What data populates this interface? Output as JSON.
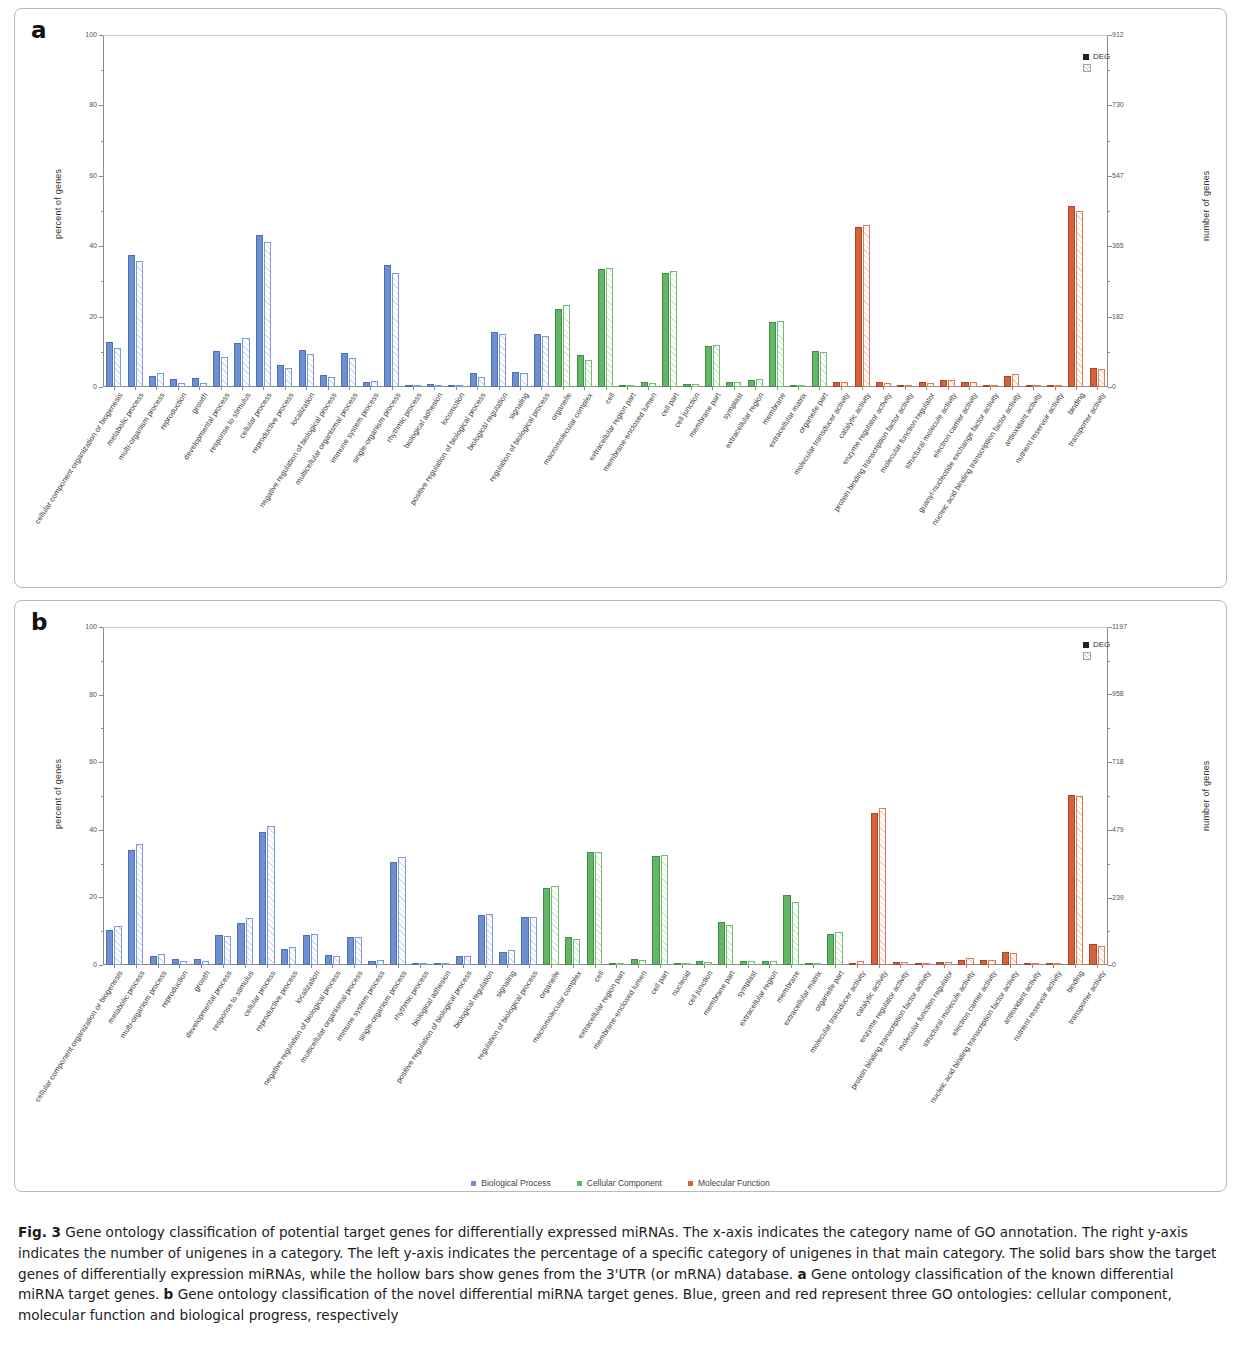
{
  "figure": {
    "label": "Fig. 3",
    "caption_parts": [
      {
        "bold": "Fig. 3",
        "text": " Gene ontology classification of potential target genes for differentially expressed miRNAs. The x-axis indicates the category name of GO annotation. The right y-axis indicates the number of unigenes in a category. The left y-axis indicates the percentage of a specific category of unigenes in that main category. The solid bars show the target genes of differentially expression miRNAs, while the hollow bars show genes from the 3'UTR (or mRNA) database. "
      },
      {
        "bold": "a",
        "text": " Gene ontology classification of the known differential miRNA target genes. "
      },
      {
        "bold": "b",
        "text": " Gene ontology classification of the novel differential miRNA target genes. Blue, green and red represent three GO ontologies: cellular component, molecular function and biological progress, respectively"
      }
    ]
  },
  "bottom_legend": [
    {
      "label": "Biological Process",
      "color": "#6e8fd0"
    },
    {
      "label": "Cellular Component",
      "color": "#64b565"
    },
    {
      "label": "Molecular Function",
      "color": "#d4623b"
    }
  ],
  "panel_a": {
    "letter": "a",
    "legend": [
      {
        "label": "DEG",
        "type": "solid"
      },
      {
        "label": "",
        "type": "hollow"
      }
    ],
    "chart_data": {
      "type": "bar",
      "title": "Gene ontology classification of the known differential miRNA target genes",
      "xlabel": "",
      "ylabel": "percent of genes",
      "y2label": "number of genes",
      "ylim": [
        0,
        100
      ],
      "yticks": [
        0,
        20,
        40,
        60,
        80,
        100
      ],
      "y2lim": [
        0,
        912
      ],
      "y2ticks": [
        0,
        182,
        365,
        547,
        730,
        912
      ],
      "grid": false,
      "legend_position": "top-right",
      "series": [
        {
          "name": "DEG",
          "style": "solid"
        },
        {
          "name": "database",
          "style": "hollow"
        }
      ],
      "groups": [
        {
          "category": "cellular component organization or biogenesis",
          "ontology": "bp",
          "deg": 12.9,
          "db": 11.0
        },
        {
          "category": "metabolic process",
          "ontology": "bp",
          "deg": 37.5,
          "db": 35.9
        },
        {
          "category": "multi-organism process",
          "ontology": "bp",
          "deg": 3.1,
          "db": 3.9
        },
        {
          "category": "reproduction",
          "ontology": "bp",
          "deg": 2.3,
          "db": 1.2
        },
        {
          "category": "growth",
          "ontology": "bp",
          "deg": 2.6,
          "db": 1.2
        },
        {
          "category": "developmental process",
          "ontology": "bp",
          "deg": 10.2,
          "db": 8.6
        },
        {
          "category": "response to stimulus",
          "ontology": "bp",
          "deg": 12.4,
          "db": 13.8
        },
        {
          "category": "cellular process",
          "ontology": "bp",
          "deg": 43.3,
          "db": 41.2
        },
        {
          "category": "reproductive process",
          "ontology": "bp",
          "deg": 6.3,
          "db": 5.3
        },
        {
          "category": "localization",
          "ontology": "bp",
          "deg": 10.4,
          "db": 9.4
        },
        {
          "category": "negative regulation of biological process",
          "ontology": "bp",
          "deg": 3.3,
          "db": 2.8
        },
        {
          "category": "multicellular organismal process",
          "ontology": "bp",
          "deg": 9.7,
          "db": 8.2
        },
        {
          "category": "immune system process",
          "ontology": "bp",
          "deg": 1.4,
          "db": 1.6
        },
        {
          "category": "single-organism process",
          "ontology": "bp",
          "deg": 34.6,
          "db": 32.4
        },
        {
          "category": "rhythmic process",
          "ontology": "bp",
          "deg": 0.7,
          "db": 0.6
        },
        {
          "category": "biological adhesion",
          "ontology": "bp",
          "deg": 0.8,
          "db": 0.6
        },
        {
          "category": "locomotion",
          "ontology": "bp",
          "deg": 0.2,
          "db": 0.2
        },
        {
          "category": "positive regulation of biological process",
          "ontology": "bp",
          "deg": 3.9,
          "db": 2.8
        },
        {
          "category": "biological regulation",
          "ontology": "bp",
          "deg": 15.6,
          "db": 15.2
        },
        {
          "category": "signaling",
          "ontology": "bp",
          "deg": 4.4,
          "db": 4.0
        },
        {
          "category": "regulation of biological process",
          "ontology": "bp",
          "deg": 15.2,
          "db": 14.4
        },
        {
          "category": "organelle",
          "ontology": "cc",
          "deg": 22.3,
          "db": 23.4
        },
        {
          "category": "macromolecular complex",
          "ontology": "cc",
          "deg": 9.0,
          "db": 7.8
        },
        {
          "category": "cell",
          "ontology": "cc",
          "deg": 33.5,
          "db": 33.9
        },
        {
          "category": "extracellular region part",
          "ontology": "cc",
          "deg": 0.2,
          "db": 0.2
        },
        {
          "category": "membrane-enclosed lumen",
          "ontology": "cc",
          "deg": 1.5,
          "db": 1.1
        },
        {
          "category": "cell part",
          "ontology": "cc",
          "deg": 32.3,
          "db": 33.0
        },
        {
          "category": "cell junction",
          "ontology": "cc",
          "deg": 0.9,
          "db": 0.9
        },
        {
          "category": "membrane part",
          "ontology": "cc",
          "deg": 11.6,
          "db": 11.9
        },
        {
          "category": "symplast",
          "ontology": "cc",
          "deg": 1.5,
          "db": 1.3
        },
        {
          "category": "extracellular region",
          "ontology": "cc",
          "deg": 1.9,
          "db": 2.4
        },
        {
          "category": "membrane",
          "ontology": "cc",
          "deg": 18.6,
          "db": 18.8
        },
        {
          "category": "extracellular matrix",
          "ontology": "cc",
          "deg": 0.2,
          "db": 0.3
        },
        {
          "category": "organelle part",
          "ontology": "cc",
          "deg": 10.2,
          "db": 9.9
        },
        {
          "category": "molecular transducer activity",
          "ontology": "mf",
          "deg": 1.3,
          "db": 1.4
        },
        {
          "category": "catalytic activity",
          "ontology": "mf",
          "deg": 45.6,
          "db": 46.0
        },
        {
          "category": "enzyme regulator activity",
          "ontology": "mf",
          "deg": 1.3,
          "db": 1.1
        },
        {
          "category": "protein binding transcription factor activity",
          "ontology": "mf",
          "deg": 0.3,
          "db": 0.3
        },
        {
          "category": "molecular function regulator",
          "ontology": "mf",
          "deg": 1.3,
          "db": 1.1
        },
        {
          "category": "structural molecule activity",
          "ontology": "mf",
          "deg": 1.9,
          "db": 2.1
        },
        {
          "category": "electron carrier activity",
          "ontology": "mf",
          "deg": 1.5,
          "db": 1.5
        },
        {
          "category": "guanyl-nucleotide exchange factor activity",
          "ontology": "mf",
          "deg": 0.3,
          "db": 0.3
        },
        {
          "category": "nucleic acid binding transcription factor activity",
          "ontology": "mf",
          "deg": 3.1,
          "db": 3.6
        },
        {
          "category": "antioxidant activity",
          "ontology": "mf",
          "deg": 0.5,
          "db": 0.5
        },
        {
          "category": "nutrient reservoir activity",
          "ontology": "mf",
          "deg": 0.2,
          "db": 0.2
        },
        {
          "category": "binding",
          "ontology": "mf",
          "deg": 51.3,
          "db": 50.1
        },
        {
          "category": "transporter activity",
          "ontology": "mf",
          "deg": 5.4,
          "db": 5.1
        }
      ]
    }
  },
  "panel_b": {
    "letter": "b",
    "legend": [
      {
        "label": "DEG",
        "type": "solid"
      },
      {
        "label": "",
        "type": "hollow"
      }
    ],
    "chart_data": {
      "type": "bar",
      "title": "Gene ontology classification of the novel differential miRNA target genes",
      "xlabel": "",
      "ylabel": "percent of genes",
      "y2label": "number of genes",
      "ylim": [
        0,
        100
      ],
      "yticks": [
        0,
        20,
        40,
        60,
        80,
        100
      ],
      "y2lim": [
        0,
        1197
      ],
      "y2ticks": [
        0,
        239,
        479,
        718,
        958,
        1197
      ],
      "grid": false,
      "legend_position": "top-right",
      "series": [
        {
          "name": "DEG",
          "style": "solid"
        },
        {
          "name": "database",
          "style": "hollow"
        }
      ],
      "groups": [
        {
          "category": "cellular component organization or biogenesis",
          "ontology": "bp",
          "deg": 10.4,
          "db": 11.6
        },
        {
          "category": "metabolic process",
          "ontology": "bp",
          "deg": 34.1,
          "db": 35.9
        },
        {
          "category": "multi-organism process",
          "ontology": "bp",
          "deg": 2.8,
          "db": 3.3
        },
        {
          "category": "reproduction",
          "ontology": "bp",
          "deg": 1.7,
          "db": 1.3
        },
        {
          "category": "growth",
          "ontology": "bp",
          "deg": 1.8,
          "db": 1.3
        },
        {
          "category": "developmental process",
          "ontology": "bp",
          "deg": 9.0,
          "db": 8.6
        },
        {
          "category": "response to stimulus",
          "ontology": "bp",
          "deg": 12.5,
          "db": 13.8
        },
        {
          "category": "cellular process",
          "ontology": "bp",
          "deg": 39.4,
          "db": 41.2
        },
        {
          "category": "reproductive process",
          "ontology": "bp",
          "deg": 4.8,
          "db": 5.2
        },
        {
          "category": "localization",
          "ontology": "bp",
          "deg": 9.0,
          "db": 9.3
        },
        {
          "category": "negative regulation of biological process",
          "ontology": "bp",
          "deg": 3.0,
          "db": 2.6
        },
        {
          "category": "multicellular organismal process",
          "ontology": "bp",
          "deg": 8.3,
          "db": 8.4
        },
        {
          "category": "immune system process",
          "ontology": "bp",
          "deg": 1.3,
          "db": 1.4
        },
        {
          "category": "single-organism process",
          "ontology": "bp",
          "deg": 30.4,
          "db": 31.9
        },
        {
          "category": "rhythmic process",
          "ontology": "bp",
          "deg": 0.4,
          "db": 0.5
        },
        {
          "category": "biological adhesion",
          "ontology": "bp",
          "deg": 0.5,
          "db": 0.6
        },
        {
          "category": "positive regulation of biological process",
          "ontology": "bp",
          "deg": 2.6,
          "db": 2.6
        },
        {
          "category": "biological regulation",
          "ontology": "bp",
          "deg": 14.9,
          "db": 15.1
        },
        {
          "category": "signaling",
          "ontology": "bp",
          "deg": 3.8,
          "db": 4.3
        },
        {
          "category": "regulation of biological process",
          "ontology": "bp",
          "deg": 14.2,
          "db": 14.3
        },
        {
          "category": "organelle",
          "ontology": "cc",
          "deg": 22.7,
          "db": 23.3
        },
        {
          "category": "macromolecular complex",
          "ontology": "cc",
          "deg": 8.2,
          "db": 7.8
        },
        {
          "category": "cell",
          "ontology": "cc",
          "deg": 33.3,
          "db": 33.5
        },
        {
          "category": "extracellular region part",
          "ontology": "cc",
          "deg": 0.2,
          "db": 0.2
        },
        {
          "category": "membrane-enclosed lumen",
          "ontology": "cc",
          "deg": 1.7,
          "db": 1.6
        },
        {
          "category": "cell part",
          "ontology": "cc",
          "deg": 32.3,
          "db": 32.6
        },
        {
          "category": "nucleoid",
          "ontology": "cc",
          "deg": 0.1,
          "db": 0.1
        },
        {
          "category": "cell junction",
          "ontology": "cc",
          "deg": 1.2,
          "db": 1.0
        },
        {
          "category": "membrane part",
          "ontology": "cc",
          "deg": 12.8,
          "db": 11.8
        },
        {
          "category": "symplast",
          "ontology": "cc",
          "deg": 1.3,
          "db": 1.2
        },
        {
          "category": "extracellular region",
          "ontology": "cc",
          "deg": 1.3,
          "db": 1.3
        },
        {
          "category": "membrane",
          "ontology": "cc",
          "deg": 20.7,
          "db": 18.6
        },
        {
          "category": "extracellular matrix",
          "ontology": "cc",
          "deg": 0.2,
          "db": 0.2
        },
        {
          "category": "organelle part",
          "ontology": "cc",
          "deg": 9.1,
          "db": 9.8
        },
        {
          "category": "molecular transducer activity",
          "ontology": "mf",
          "deg": 0.7,
          "db": 1.2
        },
        {
          "category": "catalytic activity",
          "ontology": "mf",
          "deg": 45.1,
          "db": 46.4
        },
        {
          "category": "enzyme regulator activity",
          "ontology": "mf",
          "deg": 0.9,
          "db": 1.0
        },
        {
          "category": "protein binding transcription factor activity",
          "ontology": "mf",
          "deg": 0.3,
          "db": 0.3
        },
        {
          "category": "molecular function regulator",
          "ontology": "mf",
          "deg": 1.0,
          "db": 1.0
        },
        {
          "category": "structural molecule activity",
          "ontology": "mf",
          "deg": 1.6,
          "db": 2.0
        },
        {
          "category": "electron carrier activity",
          "ontology": "mf",
          "deg": 1.4,
          "db": 1.5
        },
        {
          "category": "nucleic acid binding transcription factor activity",
          "ontology": "mf",
          "deg": 3.9,
          "db": 3.5
        },
        {
          "category": "antioxidant activity",
          "ontology": "mf",
          "deg": 0.5,
          "db": 0.5
        },
        {
          "category": "nutrient reservoir activity",
          "ontology": "mf",
          "deg": 0.2,
          "db": 0.2
        },
        {
          "category": "binding",
          "ontology": "mf",
          "deg": 50.2,
          "db": 50.1
        },
        {
          "category": "transporter activity",
          "ontology": "mf",
          "deg": 6.2,
          "db": 5.6
        }
      ]
    }
  }
}
